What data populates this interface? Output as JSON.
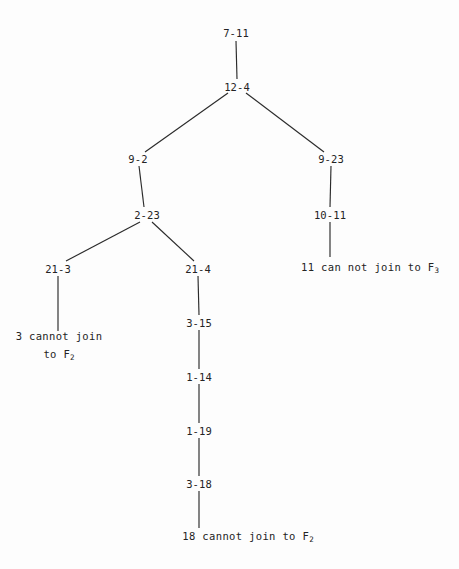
{
  "diagram": {
    "type": "tree",
    "title": "",
    "background_color": "#fdfdfd",
    "line_color": "#2b2b2b",
    "text_color": "#242424",
    "nodes": [
      {
        "id": "n0",
        "label": "7-11",
        "x": 236,
        "y": 33,
        "kind": "node"
      },
      {
        "id": "n1",
        "label": "12-4",
        "x": 237,
        "y": 87,
        "kind": "node"
      },
      {
        "id": "n2",
        "label": "9-2",
        "x": 138,
        "y": 159,
        "kind": "node"
      },
      {
        "id": "n3",
        "label": "9-23",
        "x": 331,
        "y": 159,
        "kind": "node"
      },
      {
        "id": "n4",
        "label": "2-23",
        "x": 147,
        "y": 215,
        "kind": "node"
      },
      {
        "id": "n5",
        "label": "10-11",
        "x": 330,
        "y": 215,
        "kind": "node"
      },
      {
        "id": "n6",
        "label": "21-3",
        "x": 58,
        "y": 269,
        "kind": "node"
      },
      {
        "id": "n7",
        "label": "21-4",
        "x": 198,
        "y": 269,
        "kind": "node"
      },
      {
        "id": "n8",
        "label": "3-15",
        "x": 199,
        "y": 323,
        "kind": "node"
      },
      {
        "id": "n9",
        "label": "1-14",
        "x": 199,
        "y": 377,
        "kind": "node"
      },
      {
        "id": "n10",
        "label": "1-19",
        "x": 199,
        "y": 431,
        "kind": "node"
      },
      {
        "id": "n11",
        "label": "3-18",
        "x": 199,
        "y": 484,
        "kind": "node"
      }
    ],
    "leaves": [
      {
        "id": "leaf-right",
        "line1": "11 can not join to F",
        "sub1": "3",
        "line2": "",
        "sub2": "",
        "x": 370,
        "y": 269,
        "kind": "leaf"
      },
      {
        "id": "leaf-left",
        "line1": "3 cannot join",
        "sub1": "",
        "line2": "to F",
        "sub2": "2",
        "x": 59,
        "y": 347,
        "kind": "leaf"
      },
      {
        "id": "leaf-bottom",
        "line1": "18 cannot join to F",
        "sub1": "2",
        "line2": "",
        "sub2": "",
        "x": 248,
        "y": 538,
        "kind": "leaf"
      }
    ],
    "edges": [
      {
        "id": "e0",
        "from": "7-11",
        "to": "12-4",
        "x1": 236,
        "y1": 41,
        "x2": 237,
        "y2": 79
      },
      {
        "id": "e1",
        "from": "12-4",
        "to": "9-2",
        "x1": 228,
        "y1": 93,
        "x2": 145,
        "y2": 152
      },
      {
        "id": "e2",
        "from": "12-4",
        "to": "9-23",
        "x1": 246,
        "y1": 93,
        "x2": 324,
        "y2": 152
      },
      {
        "id": "e3",
        "from": "9-2",
        "to": "2-23",
        "x1": 139,
        "y1": 166,
        "x2": 144,
        "y2": 207
      },
      {
        "id": "e4",
        "from": "9-23",
        "to": "10-11",
        "x1": 331,
        "y1": 166,
        "x2": 330,
        "y2": 207
      },
      {
        "id": "e5",
        "from": "2-23",
        "to": "21-3",
        "x1": 140,
        "y1": 222,
        "x2": 66,
        "y2": 261
      },
      {
        "id": "e6",
        "from": "2-23",
        "to": "21-4",
        "x1": 152,
        "y1": 222,
        "x2": 194,
        "y2": 261
      },
      {
        "id": "e7",
        "from": "10-11",
        "to": "11 can not join",
        "x1": 330,
        "y1": 222,
        "x2": 330,
        "y2": 257
      },
      {
        "id": "e8",
        "from": "21-3",
        "to": "3 cannot join",
        "x1": 58,
        "y1": 276,
        "x2": 58,
        "y2": 331
      },
      {
        "id": "e9",
        "from": "21-4",
        "to": "3-15",
        "x1": 198,
        "y1": 276,
        "x2": 199,
        "y2": 315
      },
      {
        "id": "e10",
        "from": "3-15",
        "to": "1-14",
        "x1": 199,
        "y1": 330,
        "x2": 199,
        "y2": 369
      },
      {
        "id": "e11",
        "from": "1-14",
        "to": "1-19",
        "x1": 199,
        "y1": 384,
        "x2": 199,
        "y2": 423
      },
      {
        "id": "e12",
        "from": "1-19",
        "to": "3-18",
        "x1": 199,
        "y1": 438,
        "x2": 199,
        "y2": 476
      },
      {
        "id": "e13",
        "from": "3-18",
        "to": "18 cannot join",
        "x1": 199,
        "y1": 491,
        "x2": 199,
        "y2": 528
      }
    ]
  }
}
